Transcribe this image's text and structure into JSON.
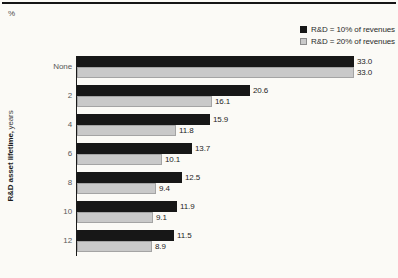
{
  "chart_data": {
    "type": "bar",
    "orientation": "horizontal",
    "xlabel": "%",
    "ylabel": "R&D asset lifetime, years",
    "ylabel_bold": "R&D asset lifetime,",
    "ylabel_unit": "years",
    "categories": [
      "None",
      "2",
      "4",
      "6",
      "8",
      "10",
      "12"
    ],
    "series": [
      {
        "name": "R&D = 10% of revenues",
        "color": "#171717",
        "values": [
          33.0,
          20.6,
          15.9,
          13.7,
          12.5,
          11.9,
          11.5
        ]
      },
      {
        "name": "R&D = 20% of revenues",
        "color": "#c9c9c9",
        "values": [
          33.0,
          16.1,
          11.8,
          10.1,
          9.4,
          9.1,
          8.9
        ]
      }
    ],
    "xlim": [
      0,
      33
    ],
    "value_labels": true,
    "value_decimals": 1,
    "legend_position": "top-right",
    "grid": false
  }
}
